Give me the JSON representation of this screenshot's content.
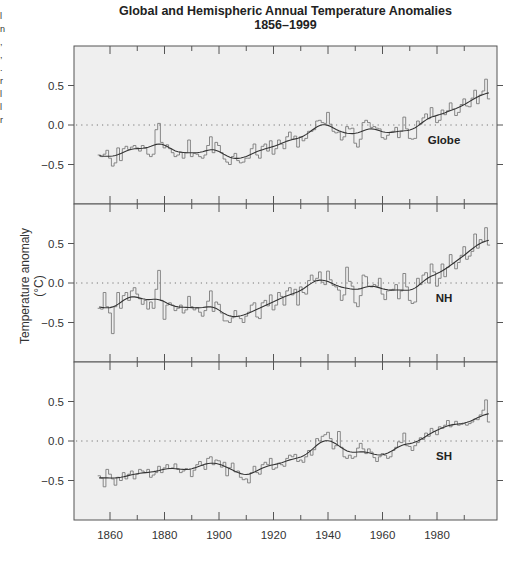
{
  "chart_data": {
    "type": "line",
    "title": "Global and Hemispheric Annual Temperature Anomalies",
    "subtitle": "1856–1999",
    "xlabel": "",
    "ylabel": "Temperature anomaly (°C)",
    "xlim": [
      1852,
      2002
    ],
    "ylim": [
      -1.0,
      1.0
    ],
    "x_ticks": [
      1860,
      1880,
      1900,
      1920,
      1940,
      1960,
      1980
    ],
    "y_ticks": [
      "0.5",
      "0.0",
      "−0.5"
    ],
    "grid": false,
    "reference_line": {
      "y": 0.0,
      "style": "dotted"
    },
    "x_start": 1856,
    "x_end": 1999,
    "panels": [
      {
        "name": "Globe",
        "label": "Globe",
        "annual": [
          -0.38,
          -0.4,
          -0.37,
          -0.32,
          -0.42,
          -0.52,
          -0.48,
          -0.29,
          -0.45,
          -0.3,
          -0.27,
          -0.31,
          -0.28,
          -0.26,
          -0.29,
          -0.33,
          -0.26,
          -0.29,
          -0.37,
          -0.4,
          -0.37,
          -0.06,
          0.02,
          -0.22,
          -0.29,
          -0.25,
          -0.3,
          -0.35,
          -0.4,
          -0.38,
          -0.34,
          -0.42,
          -0.35,
          -0.19,
          -0.4,
          -0.36,
          -0.37,
          -0.4,
          -0.42,
          -0.38,
          -0.26,
          -0.15,
          -0.35,
          -0.22,
          -0.26,
          -0.35,
          -0.43,
          -0.47,
          -0.5,
          -0.4,
          -0.36,
          -0.45,
          -0.48,
          -0.47,
          -0.42,
          -0.42,
          -0.3,
          -0.24,
          -0.38,
          -0.42,
          -0.27,
          -0.24,
          -0.33,
          -0.2,
          -0.37,
          -0.3,
          -0.19,
          -0.24,
          -0.3,
          -0.15,
          -0.09,
          -0.18,
          -0.14,
          -0.28,
          -0.15,
          -0.2,
          -0.17,
          -0.08,
          -0.08,
          -0.06,
          0.05,
          0.06,
          0.03,
          0.02,
          0.16,
          0.01,
          -0.08,
          -0.1,
          -0.09,
          -0.19,
          -0.15,
          -0.02,
          -0.05,
          -0.04,
          -0.23,
          -0.28,
          -0.18,
          0.03,
          0.06,
          0.03,
          -0.03,
          -0.02,
          -0.04,
          -0.05,
          -0.16,
          -0.18,
          -0.13,
          -0.09,
          -0.08,
          -0.03,
          -0.16,
          -0.08,
          0.1,
          -0.05,
          -0.17,
          -0.18,
          -0.17,
          0.05,
          0.01,
          0.09,
          0.14,
          0.08,
          0.22,
          0.11,
          0.03,
          0.06,
          0.19,
          0.13,
          0.18,
          0.28,
          0.2,
          0.12,
          0.16,
          0.26,
          0.33,
          0.24,
          0.23,
          0.34,
          0.44,
          0.27,
          0.38,
          0.43,
          0.58,
          0.33
        ]
      },
      {
        "name": "NH",
        "label": "NH",
        "annual": [
          -0.32,
          -0.33,
          -0.12,
          -0.3,
          -0.38,
          -0.64,
          -0.3,
          -0.12,
          -0.32,
          -0.16,
          -0.12,
          -0.22,
          -0.1,
          -0.06,
          -0.14,
          -0.2,
          -0.27,
          -0.22,
          -0.33,
          -0.24,
          -0.32,
          -0.08,
          0.16,
          -0.22,
          -0.46,
          -0.28,
          -0.25,
          -0.28,
          -0.35,
          -0.32,
          -0.28,
          -0.38,
          -0.34,
          -0.17,
          -0.3,
          -0.34,
          -0.31,
          -0.37,
          -0.42,
          -0.35,
          -0.23,
          -0.1,
          -0.36,
          -0.24,
          -0.27,
          -0.38,
          -0.48,
          -0.48,
          -0.5,
          -0.44,
          -0.35,
          -0.42,
          -0.45,
          -0.5,
          -0.42,
          -0.37,
          -0.28,
          -0.25,
          -0.43,
          -0.45,
          -0.25,
          -0.22,
          -0.29,
          -0.15,
          -0.34,
          -0.28,
          -0.12,
          -0.17,
          -0.28,
          -0.1,
          -0.06,
          -0.15,
          -0.08,
          -0.28,
          -0.05,
          -0.12,
          -0.14,
          0.03,
          0.1,
          0.03,
          0.06,
          0.14,
          0.01,
          -0.02,
          0.15,
          0.04,
          -0.03,
          -0.05,
          -0.09,
          -0.22,
          -0.15,
          0.2,
          0.02,
          -0.04,
          -0.25,
          -0.3,
          -0.16,
          0.1,
          0.08,
          -0.04,
          -0.05,
          -0.02,
          -0.04,
          0.06,
          -0.14,
          -0.21,
          -0.1,
          -0.09,
          -0.08,
          -0.02,
          -0.2,
          -0.1,
          0.12,
          -0.05,
          -0.22,
          -0.26,
          -0.24,
          0.06,
          -0.02,
          0.1,
          0.13,
          0.0,
          0.24,
          0.14,
          -0.04,
          0.06,
          0.24,
          0.08,
          0.2,
          0.36,
          0.25,
          0.18,
          0.26,
          0.35,
          0.46,
          0.3,
          0.34,
          0.4,
          0.62,
          0.44,
          0.55,
          0.52,
          0.7,
          0.48
        ]
      },
      {
        "name": "SH",
        "label": "SH",
        "annual": [
          -0.44,
          -0.47,
          -0.58,
          -0.36,
          -0.42,
          -0.48,
          -0.56,
          -0.46,
          -0.5,
          -0.4,
          -0.48,
          -0.42,
          -0.38,
          -0.48,
          -0.42,
          -0.36,
          -0.38,
          -0.4,
          -0.36,
          -0.46,
          -0.43,
          -0.4,
          -0.32,
          -0.4,
          -0.34,
          -0.3,
          -0.35,
          -0.34,
          -0.29,
          -0.36,
          -0.4,
          -0.38,
          -0.35,
          -0.36,
          -0.45,
          -0.37,
          -0.3,
          -0.26,
          -0.31,
          -0.36,
          -0.22,
          -0.2,
          -0.3,
          -0.24,
          -0.25,
          -0.33,
          -0.27,
          -0.44,
          -0.34,
          -0.28,
          -0.39,
          -0.38,
          -0.46,
          -0.49,
          -0.48,
          -0.53,
          -0.4,
          -0.32,
          -0.4,
          -0.42,
          -0.3,
          -0.27,
          -0.3,
          -0.22,
          -0.36,
          -0.34,
          -0.28,
          -0.3,
          -0.32,
          -0.22,
          -0.18,
          -0.2,
          -0.17,
          -0.26,
          -0.24,
          -0.27,
          -0.2,
          -0.12,
          -0.18,
          -0.11,
          0.03,
          0.0,
          0.06,
          0.08,
          0.11,
          0.03,
          -0.1,
          -0.06,
          0.12,
          -0.08,
          -0.2,
          -0.22,
          -0.18,
          -0.22,
          -0.2,
          -0.09,
          -0.03,
          -0.1,
          -0.16,
          -0.1,
          -0.14,
          -0.21,
          -0.26,
          -0.2,
          -0.16,
          -0.18,
          -0.22,
          -0.2,
          -0.12,
          -0.08,
          -0.01,
          -0.02,
          0.1,
          -0.06,
          -0.07,
          -0.12,
          -0.06,
          -0.02,
          0.04,
          0.02,
          0.1,
          0.06,
          0.16,
          0.12,
          0.08,
          0.18,
          0.16,
          0.2,
          0.26,
          0.18,
          0.21,
          0.25,
          0.2,
          0.21,
          0.22,
          0.2,
          0.22,
          0.24,
          0.28,
          0.27,
          0.33,
          0.39,
          0.52,
          0.24
        ]
      }
    ],
    "series_styles": {
      "annual": {
        "type": "step",
        "color": "#7a7a7a"
      },
      "smoothed": {
        "type": "smooth-line",
        "color": "#333333"
      }
    }
  },
  "colors": {
    "plot_background": "#efefef",
    "frame": "#555555",
    "annual_line": "#7a7a7a",
    "smooth_line": "#333333",
    "zero_line": "#777777",
    "text": "#222222"
  },
  "edge_fragment": {
    "text": "l\nn\n,\n,\n.\nr\nl\nl\nr"
  }
}
